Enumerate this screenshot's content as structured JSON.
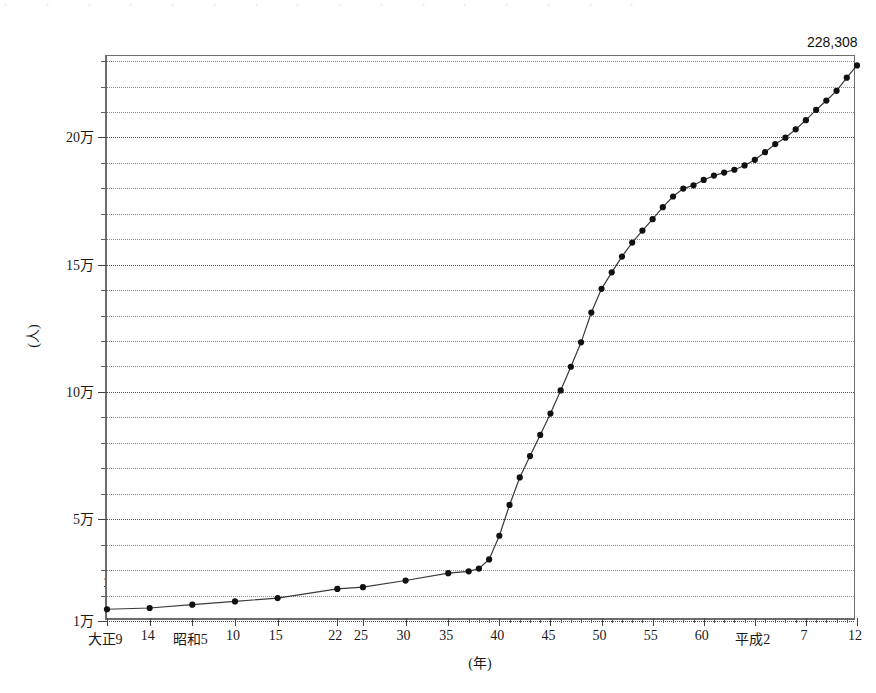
{
  "page": {
    "top_cut_text": "・ ・ ・ ・ ・ ・ ・ ・ ・ ・ ・ ・ ・ ・ ・ ・"
  },
  "chart_data": {
    "type": "line",
    "title": "",
    "xlabel": "(年)",
    "ylabel": "(人)",
    "ylim": [
      10000,
      232000
    ],
    "ytick_labels": [
      "1万",
      "5万",
      "10万",
      "15万",
      "20万"
    ],
    "ytick_values": [
      10000,
      50000,
      100000,
      150000,
      200000
    ],
    "yminor_step": 10000,
    "grid": true,
    "legend": false,
    "annotations": [
      {
        "name": "first-point-label",
        "text": "14,617",
        "x": 1920,
        "y": 14617
      },
      {
        "name": "last-point-label",
        "text": "228,308",
        "x": 2000,
        "y": 228308
      }
    ],
    "xtick_labels": [
      {
        "label": "大正9",
        "year": 1920
      },
      {
        "label": "14",
        "year": 1925
      },
      {
        "label": "昭和5",
        "year": 1930
      },
      {
        "label": "10",
        "year": 1935
      },
      {
        "label": "15",
        "year": 1940
      },
      {
        "label": "22",
        "year": 1947
      },
      {
        "label": "25",
        "year": 1950
      },
      {
        "label": "30",
        "year": 1955
      },
      {
        "label": "35",
        "year": 1960
      },
      {
        "label": "40",
        "year": 1965
      },
      {
        "label": "45",
        "year": 1970
      },
      {
        "label": "50",
        "year": 1975
      },
      {
        "label": "55",
        "year": 1980
      },
      {
        "label": "60",
        "year": 1985
      },
      {
        "label": "平成2",
        "year": 1990
      },
      {
        "label": "7",
        "year": 1995
      },
      {
        "label": "12",
        "year": 2000
      }
    ],
    "x": [
      1920,
      1925,
      1930,
      1935,
      1940,
      1947,
      1950,
      1955,
      1960,
      1962,
      1963,
      1964,
      1965,
      1966,
      1967,
      1968,
      1969,
      1970,
      1971,
      1972,
      1973,
      1974,
      1975,
      1976,
      1977,
      1978,
      1979,
      1980,
      1981,
      1982,
      1983,
      1984,
      1985,
      1986,
      1987,
      1988,
      1989,
      1990,
      1991,
      1992,
      1993,
      1994,
      1995,
      1996,
      1997,
      1998,
      1999,
      2000
    ],
    "values": [
      14617,
      15100,
      16400,
      17700,
      19000,
      22600,
      23300,
      25900,
      28800,
      29500,
      30600,
      34200,
      43500,
      55600,
      66400,
      74800,
      83100,
      91500,
      100600,
      109900,
      119500,
      131200,
      140500,
      147000,
      153200,
      158700,
      163400,
      167900,
      172600,
      176800,
      179900,
      181200,
      183300,
      185000,
      186200,
      187300,
      189000,
      191200,
      194200,
      197400,
      199900,
      203200,
      206800,
      210800,
      214500,
      218300,
      223500,
      228308
    ],
    "series_name": "人口",
    "marker": "filled-circle",
    "line_color": "#3a3a3a",
    "marker_color": "#111111"
  }
}
